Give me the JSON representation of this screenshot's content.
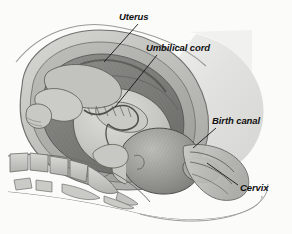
{
  "figure": {
    "background_color": "#fbfbfa",
    "width": 292,
    "height": 234,
    "watermark_text": "",
    "label_color": "#111111",
    "leader_line_color": "#161616"
  },
  "labels": [
    {
      "id": "uterus",
      "text": "Uterus",
      "x": 119,
      "y": 12,
      "leader": {
        "x1": 138,
        "y1": 24,
        "x2": 104,
        "y2": 62
      }
    },
    {
      "id": "umbilical-cord",
      "text": "Umbilical cord",
      "x": 146,
      "y": 43,
      "leader": {
        "x1": 157,
        "y1": 55,
        "x2": 115,
        "y2": 107
      }
    },
    {
      "id": "birth-canal",
      "text": "Birth canal",
      "x": 212,
      "y": 116,
      "leader": {
        "x1": 216,
        "y1": 128,
        "x2": 193,
        "y2": 148
      }
    },
    {
      "id": "cervix",
      "text": "Cervix",
      "x": 240,
      "y": 183,
      "leader": {
        "x1": 238,
        "y1": 185,
        "x2": 207,
        "y2": 163
      }
    }
  ],
  "anatomy": {
    "parts": [
      {
        "id": "abdominal-wall",
        "name": "Maternal abdominal wall",
        "fill": "#e3e3e1"
      },
      {
        "id": "uterine-wall",
        "name": "Uterine wall",
        "fill": "#b9b9b6"
      },
      {
        "id": "amniotic-cavity",
        "name": "Amniotic cavity",
        "fill": "#8e8e8b"
      },
      {
        "id": "fetus-body",
        "name": "Fetus",
        "fill": "#cfcfcb"
      },
      {
        "id": "fetal-head",
        "name": "Fetal head",
        "fill": "#9b9b97"
      },
      {
        "id": "umbilical-cord",
        "name": "Umbilical cord",
        "fill": "#c4c4c0"
      },
      {
        "id": "sacrum-spine",
        "name": "Sacrum and vertebrae",
        "fill": "#c9c9c5"
      },
      {
        "id": "cervix",
        "name": "Cervix",
        "fill": "#a8a8a4"
      },
      {
        "id": "birth-canal",
        "name": "Birth canal / vagina",
        "fill": "#bdbdb9"
      }
    ]
  }
}
